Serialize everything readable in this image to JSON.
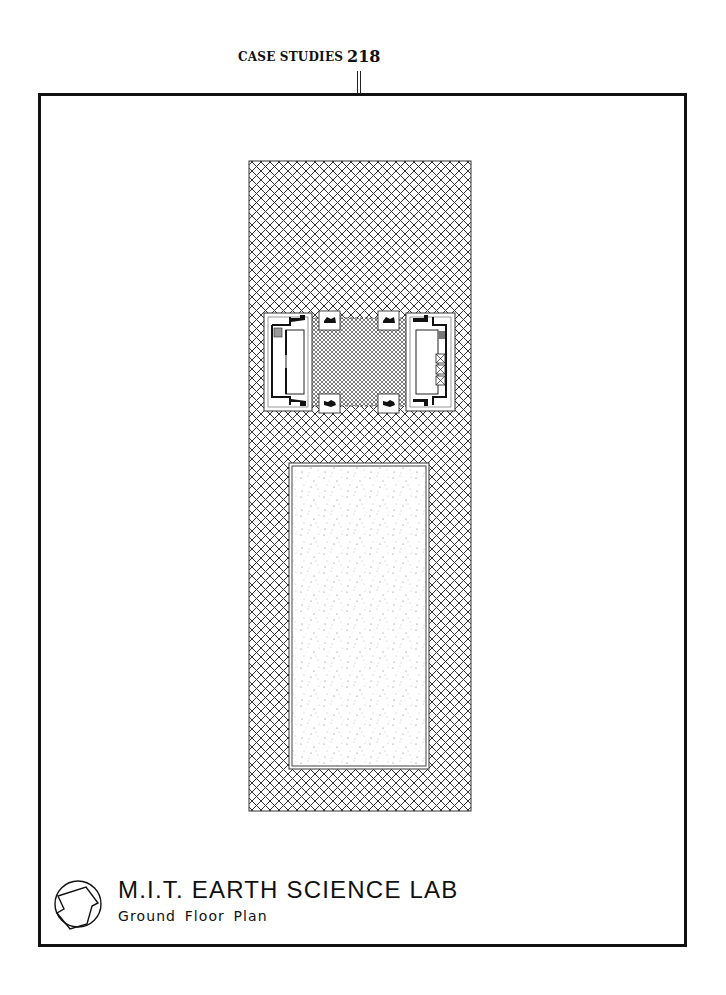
{
  "running_head": {
    "section": "CASE STUDIES",
    "page_number": "218"
  },
  "drawing": {
    "type": "architectural ground floor plan",
    "hatch_pattern_outer": "diagonal crosshatch (site / plaza)",
    "hatch_pattern_center": "fine diagonal crosshatch (open ground floor between towers)",
    "stipple_area": "stippled rectangle (landscaped court)",
    "elements": [
      "west core block with stair",
      "east core block with three elevators",
      "four column pads"
    ]
  },
  "caption": {
    "logo": "circle-pentagon-logo",
    "title": "M.I.T. EARTH SCIENCE LAB",
    "subtitle": "Ground Floor Plan"
  },
  "colors": {
    "ink": "#111111",
    "paper": "#ffffff"
  }
}
